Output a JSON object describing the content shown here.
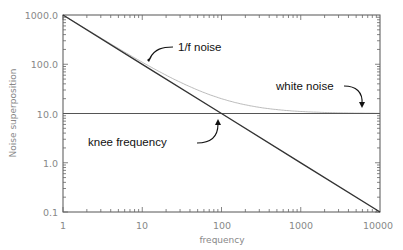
{
  "chart_data": {
    "type": "line",
    "title": "",
    "xlabel": "frequency",
    "ylabel": "Noise superposition",
    "xscale": "log",
    "yscale": "log",
    "xlim": [
      1,
      10000
    ],
    "ylim": [
      0.1,
      1000
    ],
    "x_ticks": [
      1,
      10,
      100,
      1000,
      10000
    ],
    "x_tick_labels": [
      "1",
      "10",
      "100",
      "1000",
      "10000"
    ],
    "y_ticks": [
      0.1,
      1,
      10,
      100,
      1000
    ],
    "y_tick_labels": [
      "0.1",
      "1.0",
      "10.0",
      "100.0",
      "1000.0"
    ],
    "grid": false,
    "legend": null,
    "series": [
      {
        "name": "1/f noise",
        "x": [
          1,
          10,
          100,
          1000,
          10000
        ],
        "values": [
          1000,
          100,
          10,
          1,
          0.1
        ],
        "color": "#333333",
        "style": "solid-thick"
      },
      {
        "name": "white noise",
        "x": [
          1,
          10,
          100,
          1000,
          10000
        ],
        "values": [
          10,
          10,
          10,
          10,
          10
        ],
        "color": "#555555",
        "style": "solid"
      },
      {
        "name": "superposition",
        "x": [
          1,
          10,
          100,
          1000,
          10000
        ],
        "values": [
          1010,
          110,
          20,
          11,
          10.1
        ],
        "color": "#aaaaaa",
        "style": "thin"
      }
    ],
    "annotations": [
      {
        "text": "1/f noise",
        "points_to": [
          12,
          90
        ]
      },
      {
        "text": "white noise",
        "points_to": [
          7500,
          10
        ]
      },
      {
        "text": "knee frequency",
        "points_to": [
          100,
          10
        ]
      }
    ]
  },
  "labels": {
    "xlabel": "frequency",
    "ylabel": "Noise superposition",
    "annot_1f": "1/f noise",
    "annot_white": "white noise",
    "annot_knee": "knee frequency",
    "xticks": [
      "1",
      "10",
      "100",
      "1000",
      "10000"
    ],
    "yticks": [
      "1000.0",
      "100.0",
      "10.0",
      "1.0",
      "0.1"
    ]
  }
}
